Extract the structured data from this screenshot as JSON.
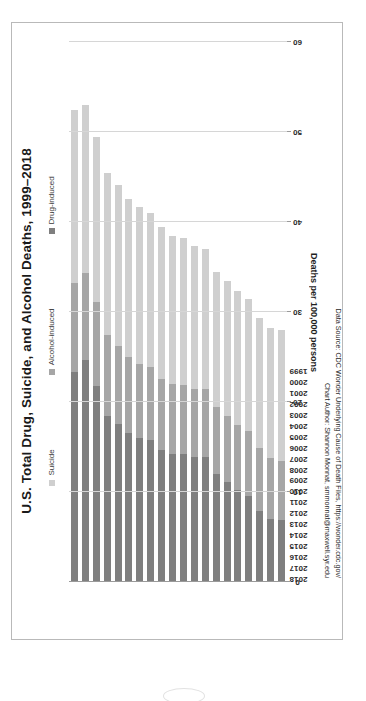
{
  "chart_data": {
    "type": "bar",
    "orientation": "horizontal-stacked",
    "title": "U.S. Total Drug, Suicide, and Alcohol Deaths, 1999–2018",
    "xlabel": "",
    "ylabel": "Deaths per 100,000 persons",
    "ylim": [
      0,
      60
    ],
    "yticks": [
      0,
      10,
      20,
      30,
      40,
      50,
      60
    ],
    "grid": true,
    "legend_position": "top",
    "categories": [
      "1999",
      "2000",
      "2001",
      "2002",
      "2003",
      "2004",
      "2005",
      "2006",
      "2007",
      "2008",
      "2009",
      "2010",
      "2011",
      "2012",
      "2013",
      "2014",
      "2015",
      "2016",
      "2017",
      "2018"
    ],
    "series": [
      {
        "name": "Drug-induced",
        "color": "#7f7f7f",
        "values": [
          6.9,
          7.0,
          7.9,
          9.6,
          10.2,
          11.1,
          12.0,
          13.9,
          13.9,
          14.2,
          14.2,
          14.7,
          15.8,
          16.0,
          16.6,
          17.5,
          18.4,
          21.8,
          24.7,
          23.3
        ]
      },
      {
        "name": "Alcohol-induced",
        "color": "#a6a6a6",
        "values": [
          6.6,
          6.8,
          7.0,
          7.2,
          7.3,
          7.4,
          7.4,
          7.6,
          7.6,
          7.7,
          7.8,
          7.9,
          8.1,
          8.2,
          8.4,
          8.7,
          9.0,
          9.3,
          9.6,
          9.9
        ]
      },
      {
        "name": "Suicide",
        "color": "#cfcfcf",
        "values": [
          14.5,
          14.4,
          14.4,
          14.7,
          14.8,
          15.0,
          15.1,
          15.5,
          15.8,
          16.3,
          16.4,
          16.8,
          17.1,
          17.5,
          17.6,
          17.9,
          18.1,
          18.4,
          18.7,
          19.2
        ]
      }
    ],
    "totals": [
      28.0,
      28.2,
      29.3,
      31.5,
      32.3,
      33.5,
      34.5,
      37.0,
      37.3,
      38.2,
      38.4,
      39.4,
      41.0,
      41.7,
      42.6,
      44.1,
      45.5,
      49.5,
      53.0,
      52.4
    ]
  },
  "legend": {
    "items": [
      {
        "label": "Suicide",
        "color": "#cfcfcf",
        "name": "legend-suicide"
      },
      {
        "label": "Alcohol-induced",
        "color": "#a6a6a6",
        "name": "legend-alcohol-induced"
      },
      {
        "label": "Drug-induced",
        "color": "#7f7f7f",
        "name": "legend-drug-induced"
      }
    ]
  },
  "axis": {
    "value_title": "Deaths per 100,000 persons",
    "value_ticks": [
      "60",
      "50",
      "40",
      "30",
      "20",
      "10",
      "0"
    ],
    "year_labels": [
      "1999",
      "2000",
      "2001",
      "2002",
      "2003",
      "2004",
      "2005",
      "2006",
      "2007",
      "2008",
      "2009",
      "2010",
      "2011",
      "2012",
      "2013",
      "2014",
      "2015",
      "2016",
      "2017",
      "2018"
    ]
  },
  "notes": {
    "line1": "Data Source: CDC Wonder Underlying Cause of Death Files, https://wonder.cdc.gov/",
    "line2": "Chart Author: Shannon Monnat, smmonnat@maxwell.syr.edu"
  }
}
